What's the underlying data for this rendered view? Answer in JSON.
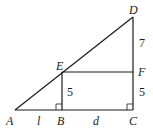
{
  "diagram": {
    "points": {
      "A": {
        "label": "A",
        "x": 15,
        "y": 110
      },
      "B": {
        "label": "B",
        "x": 62,
        "y": 110
      },
      "C": {
        "label": "C",
        "x": 133,
        "y": 110
      },
      "D": {
        "label": "D",
        "x": 133,
        "y": 17
      },
      "E": {
        "label": "E",
        "x": 62,
        "y": 72
      },
      "F": {
        "label": "F",
        "x": 133,
        "y": 72
      }
    },
    "segment_labels": {
      "AB": "l",
      "BC": "d",
      "BE": "5",
      "CF": "5",
      "FD": "7"
    },
    "right_angles": [
      "B",
      "C"
    ],
    "colors": {
      "stroke": "#1a1a1a",
      "background": "#ffffff"
    }
  }
}
